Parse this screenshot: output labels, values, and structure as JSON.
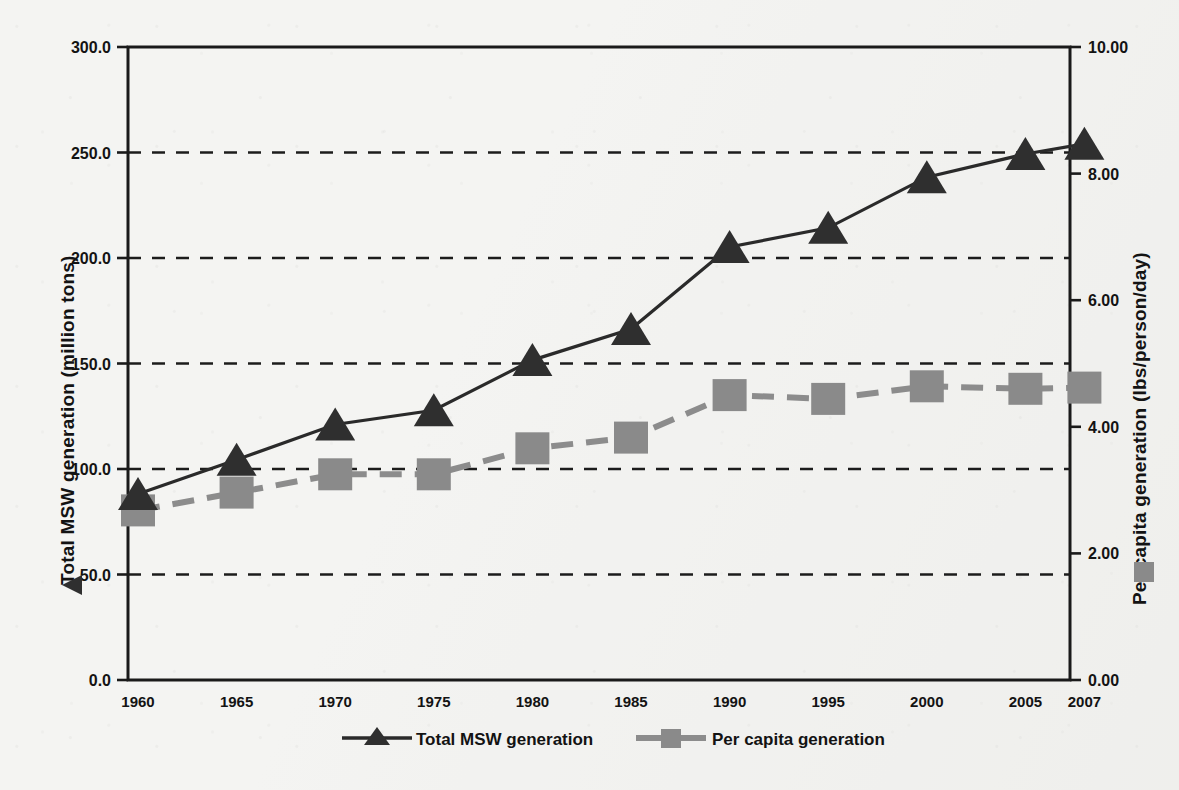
{
  "chart_data": {
    "type": "line",
    "title": "",
    "xlabel": "",
    "ylabel": "Total MSW generation (million tons)",
    "y2label": "Per capita generation (lbs/person/day)",
    "x": [
      1960,
      1965,
      1970,
      1975,
      1980,
      1985,
      1990,
      1995,
      2000,
      2005,
      2007
    ],
    "categories": [
      "1960",
      "1965",
      "1970",
      "1975",
      "1980",
      "1985",
      "1990",
      "1995",
      "2000",
      "2005",
      "2007"
    ],
    "ylim": [
      0.0,
      300.0
    ],
    "y2lim": [
      0.0,
      10.0
    ],
    "yticks": [
      "0.0",
      "50.0",
      "100.0",
      "150.0",
      "200.0",
      "250.0",
      "300.0"
    ],
    "ytick_values": [
      0.0,
      50.0,
      100.0,
      150.0,
      200.0,
      250.0,
      300.0
    ],
    "y2ticks": [
      "0.00",
      "2.00",
      "4.00",
      "6.00",
      "8.00",
      "10.00"
    ],
    "y2tick_values": [
      0.0,
      2.0,
      4.0,
      6.0,
      8.0,
      10.0
    ],
    "grid": true,
    "grid_style": "dashed-horizontal",
    "legend_position": "bottom-center",
    "series": [
      {
        "name": "Total MSW generation",
        "axis": "left",
        "marker": "triangle",
        "line_style": "solid",
        "color": "#2f2f2f",
        "values": [
          88.1,
          104.4,
          121.1,
          127.8,
          151.6,
          166.3,
          205.2,
          214.3,
          238.3,
          249.3,
          254.1
        ]
      },
      {
        "name": "Per capita generation",
        "axis": "right",
        "marker": "square",
        "line_style": "dashed",
        "color": "#8a8a8a",
        "values": [
          2.68,
          2.96,
          3.25,
          3.25,
          3.66,
          3.83,
          4.5,
          4.44,
          4.64,
          4.6,
          4.62
        ]
      }
    ]
  },
  "legend": {
    "items": [
      {
        "label": "Total MSW generation",
        "marker": "triangle",
        "color": "#2f2f2f"
      },
      {
        "label": "Per capita generation",
        "marker": "square",
        "color": "#8a8a8a"
      }
    ]
  },
  "axes": {
    "left": {
      "title": "Total MSW generation (million tons)"
    },
    "right": {
      "title": "Per capita generation (lbs/person/day)"
    }
  }
}
